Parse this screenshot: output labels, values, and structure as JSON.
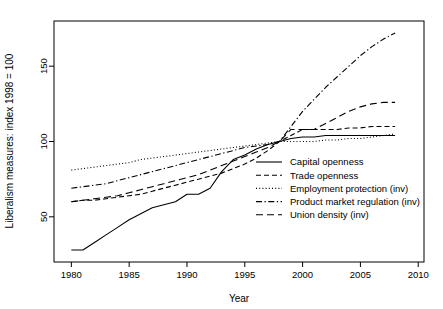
{
  "chart_data": {
    "type": "line",
    "title": "",
    "xlabel": "Year",
    "ylabel": "Liberalism measures: index 1998 = 100",
    "xlim": [
      1978.5,
      2010.5
    ],
    "ylim": [
      20,
      180
    ],
    "xticks": [
      1980,
      1985,
      1990,
      1995,
      2000,
      2005,
      2010
    ],
    "yticks": [
      50,
      100,
      150
    ],
    "grid": false,
    "legend_position": "center-right-inside",
    "series": [
      {
        "name": "Capital openness",
        "style": "solid",
        "x": [
          1980,
          1981,
          1982,
          1983,
          1984,
          1985,
          1986,
          1987,
          1988,
          1989,
          1990,
          1991,
          1992,
          1993,
          1994,
          1995,
          1996,
          1997,
          1998,
          1999,
          2000,
          2001,
          2002,
          2003,
          2004,
          2005,
          2006,
          2007,
          2008
        ],
        "values": [
          28,
          28,
          33,
          38,
          43,
          48,
          52,
          56,
          58,
          60,
          65,
          65,
          69,
          80,
          88,
          91,
          95,
          98,
          100,
          102,
          103,
          103,
          104,
          104,
          104,
          104,
          104,
          104,
          104
        ]
      },
      {
        "name": "Trade openness",
        "style": "dashed",
        "x": [
          1980,
          1981,
          1982,
          1983,
          1984,
          1985,
          1986,
          1987,
          1988,
          1989,
          1990,
          1991,
          1992,
          1993,
          1994,
          1995,
          1996,
          1997,
          1998,
          1999,
          2000,
          2001,
          2002,
          2003,
          2004,
          2005,
          2006,
          2007,
          2008
        ],
        "values": [
          60,
          61,
          61,
          62,
          63,
          64,
          65,
          67,
          69,
          71,
          73,
          75,
          77,
          79,
          82,
          85,
          89,
          94,
          100,
          104,
          108,
          108,
          108,
          108,
          109,
          109,
          110,
          110,
          110
        ]
      },
      {
        "name": "Employment protection (inv)",
        "style": "dotted",
        "x": [
          1980,
          1981,
          1982,
          1983,
          1984,
          1985,
          1986,
          1987,
          1988,
          1989,
          1990,
          1991,
          1992,
          1993,
          1994,
          1995,
          1996,
          1997,
          1998,
          1999,
          2000,
          2001,
          2002,
          2003,
          2004,
          2005,
          2006,
          2007,
          2008
        ],
        "values": [
          81,
          82,
          83,
          84,
          85,
          86,
          88,
          89,
          90,
          91,
          92,
          93,
          94,
          95,
          96,
          97,
          98,
          99,
          100,
          100,
          100,
          100,
          101,
          101,
          102,
          102,
          103,
          104,
          105
        ]
      },
      {
        "name": "Product market regulation (inv)",
        "style": "dashdot",
        "x": [
          1980,
          1981,
          1982,
          1983,
          1984,
          1985,
          1986,
          1987,
          1988,
          1989,
          1990,
          1991,
          1992,
          1993,
          1994,
          1995,
          1996,
          1997,
          1998,
          1999,
          2000,
          2001,
          2002,
          2003,
          2004,
          2005,
          2006,
          2007,
          2008
        ],
        "values": [
          69,
          70,
          71,
          72,
          74,
          76,
          78,
          80,
          82,
          84,
          86,
          88,
          90,
          92,
          94,
          96,
          97,
          98,
          100,
          110,
          120,
          128,
          136,
          143,
          150,
          157,
          163,
          168,
          172
        ]
      },
      {
        "name": "Union density (inv)",
        "style": "longdash",
        "x": [
          1980,
          1981,
          1982,
          1983,
          1984,
          1985,
          1986,
          1987,
          1988,
          1989,
          1990,
          1991,
          1992,
          1993,
          1994,
          1995,
          1996,
          1997,
          1998,
          1999,
          2000,
          2001,
          2002,
          2003,
          2004,
          2005,
          2006,
          2007,
          2008
        ],
        "values": [
          60,
          61,
          62,
          63,
          64,
          66,
          68,
          70,
          72,
          74,
          76,
          78,
          81,
          84,
          87,
          90,
          93,
          96,
          100,
          108,
          108,
          108,
          112,
          116,
          120,
          123,
          125,
          126,
          126
        ]
      }
    ]
  }
}
